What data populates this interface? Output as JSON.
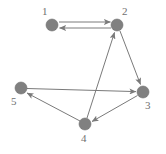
{
  "figure": {
    "type": "directed-graph",
    "width": 166,
    "height": 154,
    "background_color": "#ffffff",
    "node_color": "#808080",
    "edge_color": "#7a7a7a",
    "label_color": "#6f6f6f",
    "node_radius": 6
  },
  "nodes": [
    {
      "id": "1",
      "label": "1",
      "x": 52,
      "y": 25,
      "label_x": 42,
      "label_y": 6
    },
    {
      "id": "2",
      "label": "2",
      "x": 117,
      "y": 25,
      "label_x": 122,
      "label_y": 6
    },
    {
      "id": "3",
      "label": "3",
      "x": 143,
      "y": 92,
      "label_x": 145,
      "label_y": 100
    },
    {
      "id": "4",
      "label": "4",
      "x": 85,
      "y": 124,
      "label_x": 81,
      "label_y": 133
    },
    {
      "id": "5",
      "label": "5",
      "x": 21,
      "y": 88,
      "label_x": 11,
      "label_y": 96
    }
  ],
  "edges": [
    {
      "id": "e-1-2",
      "from": "1",
      "to": "2",
      "directed": true,
      "arrow_at": "2",
      "note": "upper parallel edge, arrowhead into node 2"
    },
    {
      "id": "e-2-1",
      "from": "2",
      "to": "1",
      "directed": true,
      "arrow_at": "1",
      "note": "lower parallel edge, arrowhead into node 1"
    },
    {
      "id": "e-2-3",
      "from": "2",
      "to": "3",
      "directed": true,
      "arrow_at": "3"
    },
    {
      "id": "e-4-2",
      "from": "4",
      "to": "2",
      "directed": true,
      "arrow_at": "2"
    },
    {
      "id": "e-5-3",
      "from": "5",
      "to": "3",
      "directed": true,
      "arrow_at": "3"
    },
    {
      "id": "e-3-4",
      "from": "3",
      "to": "4",
      "directed": true,
      "arrow_at": "4"
    },
    {
      "id": "e-4-5",
      "from": "4",
      "to": "5",
      "directed": true,
      "arrow_at": "5"
    }
  ]
}
